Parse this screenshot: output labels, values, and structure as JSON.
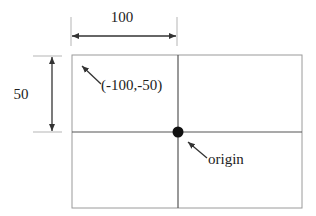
{
  "diagram": {
    "type": "coordinate-system",
    "dimensions": {
      "horizontal": {
        "label": "100"
      },
      "vertical": {
        "label": "50"
      }
    },
    "annotations": {
      "corner": {
        "label": "(-100,-50)"
      },
      "origin": {
        "label": "origin"
      }
    },
    "colors": {
      "frame": "#9a9a9a",
      "axis": "#555555",
      "dimension": "#333333",
      "extension": "#b5b5b5",
      "origin_dot": "#111111",
      "text": "#222222"
    }
  }
}
